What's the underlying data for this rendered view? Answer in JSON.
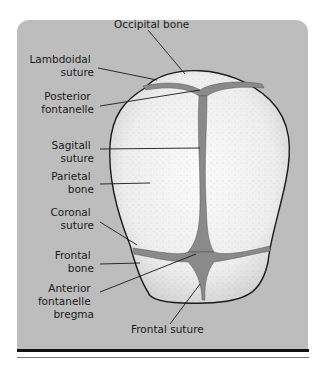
{
  "figure": {
    "labels": {
      "occipital_bone": "Occipital bone",
      "lambdoidal_suture": [
        "Lambdoidal",
        "suture"
      ],
      "posterior_fontanelle": [
        "Posterior",
        "fontanelle"
      ],
      "sagittal_suture": [
        "Sagitall",
        "suture"
      ],
      "parietal_bone": [
        "Parietal",
        "bone"
      ],
      "coronal_suture": [
        "Coronal",
        "suture"
      ],
      "frontal_bone": [
        "Frontal",
        "bone"
      ],
      "anterior_fontanelle": [
        "Anterior",
        "fontanelle",
        "bregma"
      ],
      "frontal_suture": "Frontal suture"
    },
    "colors": {
      "panel": "#bdbdbd",
      "bone": "#f4f4f4",
      "suture": "#8a8a8a",
      "outline": "#1a1a1a"
    }
  }
}
